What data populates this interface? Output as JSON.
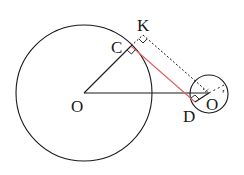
{
  "diagram": {
    "labels": {
      "O": "O",
      "C": "C",
      "K": "K",
      "D": "D",
      "O_prime": "O",
      "prime_mark": "′"
    },
    "colors": {
      "stroke": "#1a1a1a",
      "tangent": "#e06060"
    },
    "elements": [
      "circle-O",
      "circle-O-prime",
      "segment-OC",
      "segment-OO-prime",
      "segment-CD",
      "segment-CK-dashed",
      "segment-KO-prime-dashed",
      "segment-DO-prime",
      "right-angle-C",
      "right-angle-K",
      "right-angle-D"
    ]
  }
}
